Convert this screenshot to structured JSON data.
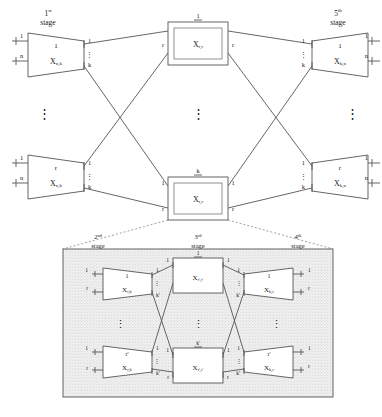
{
  "figure": {
    "type": "diagram",
    "background": "#ffffff",
    "line_color": "#555555",
    "text_color": "#1a1a1a",
    "inset_fill": "#efefef"
  },
  "stage_labels": {
    "first": {
      "ordinal": "1",
      "sup": "st",
      "word": "stage"
    },
    "fifth": {
      "ordinal": "5",
      "sup": "th",
      "word": "stage"
    },
    "second": {
      "ordinal": "2",
      "sup": "nd",
      "word": "stage"
    },
    "third": {
      "ordinal": "3",
      "sup": "rd",
      "word": "stage"
    },
    "fourth": {
      "ordinal": "4",
      "sup": "th",
      "word": "stage"
    }
  },
  "outer": {
    "left_top": {
      "block_label": "X",
      "block_sub": "n,k",
      "top_port": "1",
      "in_top": "1",
      "in_bottom": "n",
      "out_top": "1",
      "out_bottom": "k",
      "ellipsis": "⋮"
    },
    "left_bottom": {
      "block_label": "X",
      "block_sub": "n,k",
      "top_port": "r",
      "in_top": "1",
      "in_bottom": "n",
      "out_top": "1",
      "out_bottom": "k",
      "ellipsis": "⋮"
    },
    "right_top": {
      "block_label": "X",
      "block_sub": "k,n",
      "top_port": "1",
      "in_top": "1",
      "in_bottom": "k",
      "out_top": "1",
      "out_bottom": "n",
      "ellipsis": "⋮"
    },
    "right_bottom": {
      "block_label": "X",
      "block_sub": "k,n",
      "top_port": "r",
      "in_top": "1",
      "in_bottom": "k",
      "out_top": "1",
      "out_bottom": "n",
      "ellipsis": "⋮"
    },
    "center_top": {
      "block_label": "X",
      "block_sub": "r,r",
      "top_port": "1",
      "in_port": "r",
      "out_port": "r"
    },
    "center_bottom": {
      "block_label": "X",
      "block_sub": "r,r",
      "top_port": "k",
      "in_top": "1",
      "out_top": "1",
      "in_bottom": "r",
      "out_bottom": "r"
    },
    "column_ellipsis": "⋮"
  },
  "inset": {
    "left_top": {
      "block_label": "X",
      "block_sub": "r,k",
      "top_port": "1",
      "in_top": "1",
      "in_bottom": "r",
      "out_top": "1",
      "out_bottom": "k'",
      "ellipsis": "⋮"
    },
    "left_bottom": {
      "block_label": "X",
      "block_sub": "r,k",
      "top_port": "r'",
      "in_top": "1",
      "in_bottom": "r",
      "out_top": "1",
      "out_bottom": "k'",
      "ellipsis": "⋮"
    },
    "right_top": {
      "block_label": "X",
      "block_sub": "k,r",
      "top_port": "1",
      "in_top": "1",
      "in_bottom": "k'",
      "out_top": "1",
      "out_bottom": "r",
      "ellipsis": "⋮"
    },
    "right_bottom": {
      "block_label": "X",
      "block_sub": "k,r",
      "top_port": "r'",
      "in_top": "1",
      "in_bottom": "k'",
      "out_top": "1",
      "out_bottom": "r",
      "ellipsis": "⋮"
    },
    "center_top": {
      "block_label": "X",
      "block_sub": "r',r'",
      "top_port": "1",
      "in_port": "1",
      "out_port": "1"
    },
    "center_bottom": {
      "block_label": "X",
      "block_sub": "r',r'",
      "top_port": "k'",
      "in_top": "1",
      "out_top": "1",
      "in_bottom": "r",
      "out_bottom": "r"
    },
    "column_ellipsis": "⋮"
  }
}
